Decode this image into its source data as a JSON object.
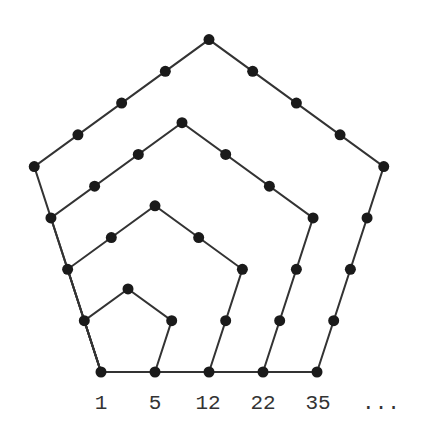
{
  "diagram": {
    "origin": [
      101,
      372
    ],
    "unit": 54,
    "dot_radius": 5.5,
    "line_color": "#333333",
    "dot_color": "#1a1a1a",
    "line_width": 2,
    "pentagons": [
      2,
      3,
      4,
      5
    ],
    "labels": [
      {
        "text": "1",
        "x": 101
      },
      {
        "text": "5",
        "x": 155
      },
      {
        "text": "12",
        "x": 208
      },
      {
        "text": "22",
        "x": 263
      },
      {
        "text": "35",
        "x": 318
      },
      {
        "text": "...",
        "x": 381
      }
    ]
  }
}
